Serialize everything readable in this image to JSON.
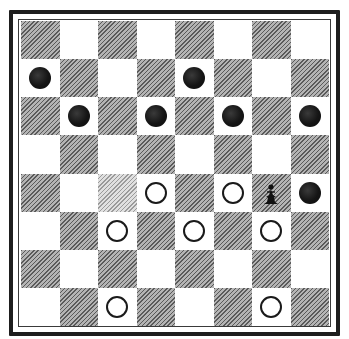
{
  "board": {
    "rows": 8,
    "cols": 8,
    "dark_square_parity": "even",
    "colors": {
      "light_square": "#ffffff",
      "dark_square": "#8f8f8f",
      "dark_square_pale": "#c8c8c8",
      "frame": "#1e1e1e",
      "black_piece": "#111111",
      "white_piece_outline": "#1a1a1a"
    },
    "pale_dark_squares": [
      [
        4,
        2
      ]
    ],
    "pieces": [
      {
        "row": 1,
        "col": 0,
        "color": "black",
        "type": "man"
      },
      {
        "row": 1,
        "col": 4,
        "color": "black",
        "type": "man"
      },
      {
        "row": 2,
        "col": 1,
        "color": "black",
        "type": "man"
      },
      {
        "row": 2,
        "col": 3,
        "color": "black",
        "type": "man"
      },
      {
        "row": 2,
        "col": 5,
        "color": "black",
        "type": "man"
      },
      {
        "row": 2,
        "col": 7,
        "color": "black",
        "type": "man"
      },
      {
        "row": 4,
        "col": 3,
        "color": "white",
        "type": "man"
      },
      {
        "row": 4,
        "col": 5,
        "color": "white",
        "type": "man"
      },
      {
        "row": 4,
        "col": 6,
        "color": "black",
        "type": "figure"
      },
      {
        "row": 4,
        "col": 7,
        "color": "black",
        "type": "man"
      },
      {
        "row": 5,
        "col": 2,
        "color": "white",
        "type": "man"
      },
      {
        "row": 5,
        "col": 4,
        "color": "white",
        "type": "man"
      },
      {
        "row": 5,
        "col": 6,
        "color": "white",
        "type": "man"
      },
      {
        "row": 7,
        "col": 2,
        "color": "white",
        "type": "man"
      },
      {
        "row": 7,
        "col": 6,
        "color": "white",
        "type": "man"
      }
    ]
  }
}
